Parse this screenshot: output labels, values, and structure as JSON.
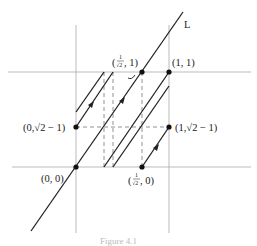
{
  "figure": {
    "caption": "Figure 4.1",
    "line_label": "L",
    "points": {
      "origin": "(0, 0)",
      "one_one": "(1, 1)",
      "zero_sqrt2m1": "(0,√2 − 1)",
      "one_sqrt2m1": "(1,√2 − 1)",
      "inv_sqrt2_one_open": "(",
      "inv_sqrt2_one_num": "1",
      "inv_sqrt2_one_den": "√2",
      "inv_sqrt2_one_close": ", 1)",
      "inv_sqrt2_zero_open": "(",
      "inv_sqrt2_zero_num": "1",
      "inv_sqrt2_zero_den": "√2",
      "inv_sqrt2_zero_close": ", 0)"
    },
    "colors": {
      "axis": "#aaaaaa",
      "line": "#222222",
      "dashed": "#777777",
      "point": "#111111"
    }
  }
}
